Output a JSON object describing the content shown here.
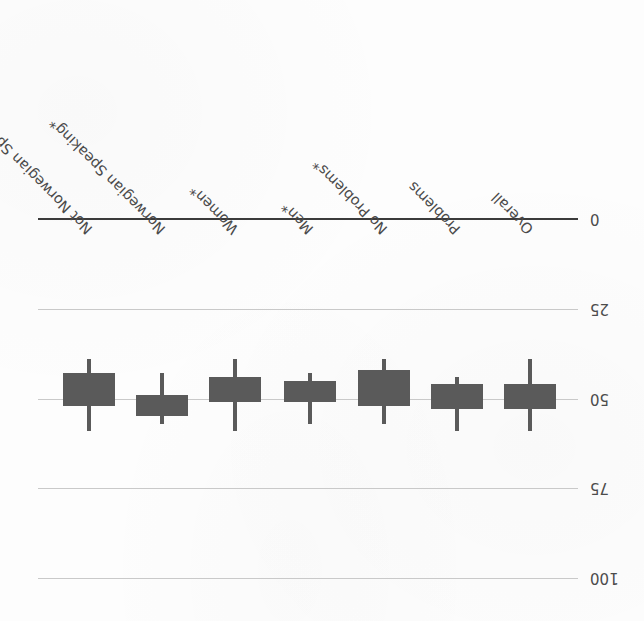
{
  "chart_data": {
    "type": "bar",
    "title": "",
    "subtitle": "",
    "xlabel": "",
    "ylabel": "",
    "orientation": "vertical-inverted",
    "rotation_degrees": 180,
    "grid": true,
    "legend": null,
    "ylim": [
      0,
      100
    ],
    "y_ticks": [
      0,
      25,
      50,
      75,
      100
    ],
    "y_tick_labels": [
      "0",
      "25",
      "50",
      "75",
      "100"
    ],
    "axis_direction": "inverted (0 at top, 100 at bottom)",
    "categories": [
      "Not Norwegian Speaking*",
      "Norwegian Speaking*",
      "Women*",
      "Men*",
      "No Problems*",
      "Problems",
      "Overall"
    ],
    "series": [
      {
        "name": "Box (interquartile range)",
        "lower": [
          43,
          49,
          44,
          45,
          42,
          46,
          46
        ],
        "upper": [
          52,
          55,
          51,
          51,
          52,
          53,
          53
        ]
      },
      {
        "name": "Whisker (range)",
        "low": [
          39,
          43,
          39,
          43,
          39,
          44,
          39
        ],
        "high": [
          59,
          57,
          59,
          57,
          57,
          59,
          59
        ]
      }
    ],
    "values": [
      48,
      52,
      48,
      48,
      47,
      50,
      50
    ],
    "annotations": {
      "asterisk_meaning": "*",
      "asterisk_categories": [
        "Not Norwegian Speaking*",
        "Norwegian Speaking*",
        "Women*",
        "Men*",
        "No Problems*"
      ]
    },
    "colors": {
      "box_fill": "#5a5a5a",
      "whisker": "#5a5a5a",
      "gridline": "#c9c9c9",
      "axis_line": "#3b3b3b",
      "background": "#fdfdfd",
      "text": "#4a4a4a"
    }
  },
  "layout": {
    "plot_left": 38,
    "plot_right": 578,
    "y_pixel_for_0": 219,
    "y_pixel_for_100": 578,
    "category_x_centers": [
      89,
      162,
      235,
      310,
      384,
      457,
      530
    ],
    "box_width": 52,
    "label_baseline_y": 212
  }
}
